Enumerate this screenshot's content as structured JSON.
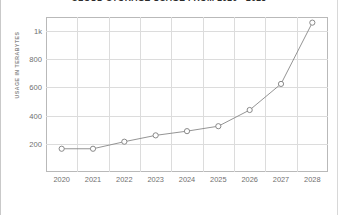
{
  "chart_data": {
    "type": "line",
    "title": "CLOUD STORAGE USAGE FROM 2020 - 2028",
    "xlabel": "",
    "ylabel": "USAGE IN TERABYTES",
    "categories": [
      "2020",
      "2021",
      "2022",
      "2023",
      "2024",
      "2025",
      "2026",
      "2027",
      "2028"
    ],
    "values": [
      165,
      165,
      215,
      260,
      290,
      325,
      440,
      625,
      1060
    ],
    "series": [
      {
        "name": "Cloud storage usage",
        "values": [
          165,
          165,
          215,
          260,
          290,
          325,
          440,
          625,
          1060
        ]
      }
    ],
    "ytick_labels": [
      "200",
      "400",
      "600",
      "800",
      "1k"
    ],
    "ytick_values": [
      200,
      400,
      600,
      800,
      1000
    ],
    "ylim": [
      0,
      1100
    ],
    "grid": true,
    "legend": "none",
    "marker": "open-circle",
    "line_color": "#888888",
    "marker_fill": "#ffffff",
    "marker_stroke": "#7d7d7d",
    "grid_color": "#dcdcdc",
    "axis_color": "#b9b9b9",
    "text_color": "#6f6f6f",
    "title_color": "#2b2b2b"
  }
}
